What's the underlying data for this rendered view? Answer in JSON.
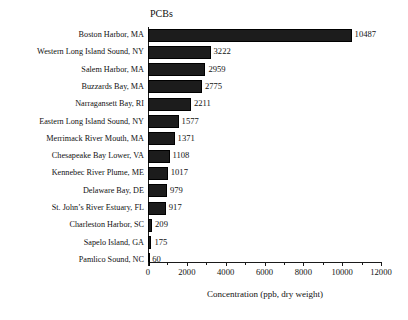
{
  "chart_data": {
    "type": "bar",
    "orientation": "horizontal",
    "title": "PCBs",
    "xlabel": "Concentration (ppb, dry weight)",
    "ylabel": "",
    "xlim": [
      0,
      12000
    ],
    "grid": false,
    "legend": null,
    "bar_color": "#1c1c1c",
    "value_labels_shown": true,
    "xticks": [
      0,
      2000,
      4000,
      6000,
      8000,
      10000,
      12000
    ],
    "xtick_labels": [
      "0",
      "2000",
      "4000",
      "6000",
      "8000",
      "10000",
      "12000"
    ],
    "xminor_ticks": [
      1000,
      3000,
      5000,
      7000,
      9000,
      11000
    ],
    "categories": [
      "Boston Harbor, MA",
      "Western Long Island Sound, NY",
      "Salem Harbor, MA",
      "Buzzards Bay, MA",
      "Narragansett Bay, RI",
      "Eastern Long Island Sound, NY",
      "Merrimack River Mouth, MA",
      "Chesapeake Bay Lower, VA",
      "Kennebec River Plume, ME",
      "Delaware Bay, DE",
      "St. John’s River Estuary, FL",
      "Charleston Harbor, SC",
      "Sapelo Island, GA",
      "Pamlico Sound, NC"
    ],
    "values": [
      10487,
      3222,
      2959,
      2775,
      2211,
      1577,
      1371,
      1108,
      1017,
      979,
      917,
      209,
      175,
      60
    ],
    "value_text": [
      "10487",
      "3222",
      "2959",
      "2775",
      "2211",
      "1577",
      "1371",
      "1108",
      "1017",
      "979",
      "917",
      "209",
      "175",
      "60"
    ]
  }
}
